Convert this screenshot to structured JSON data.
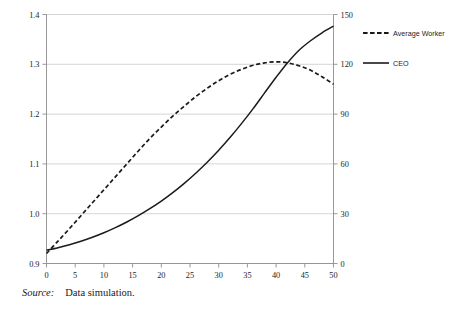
{
  "source_note": {
    "label": "Source:",
    "text": "Data simulation."
  },
  "chart_data": {
    "type": "line",
    "title": "",
    "xlabel": "",
    "ylabel": "",
    "grid": true,
    "legend_position": "right",
    "xlim": [
      0,
      50
    ],
    "xticks": [
      0,
      5,
      10,
      15,
      20,
      25,
      30,
      35,
      40,
      45,
      50
    ],
    "xtick_labels": [
      "0",
      "5",
      "10",
      "15",
      "20",
      "25",
      "30",
      "35",
      "40",
      "45",
      "50"
    ],
    "left_axis": {
      "name": "Average Worker",
      "ylim": [
        0.9,
        1.4
      ],
      "yticks": [
        0.9,
        1.0,
        1.1,
        1.2,
        1.3,
        1.4
      ],
      "ytick_labels": [
        "0.9",
        "1.0",
        "1.1",
        "1.2",
        "1.3",
        "1.4"
      ]
    },
    "right_axis": {
      "name": "CEO",
      "ylim": [
        0,
        150
      ],
      "yticks": [
        0,
        30,
        60,
        90,
        120,
        150
      ],
      "ytick_labels": [
        "0",
        "30",
        "60",
        "90",
        "120",
        "150"
      ]
    },
    "x": [
      0,
      2,
      4,
      6,
      8,
      10,
      12,
      14,
      16,
      18,
      20,
      22,
      24,
      26,
      28,
      30,
      32,
      34,
      36,
      38,
      40,
      42,
      44,
      46,
      48,
      50
    ],
    "series": [
      {
        "name": "Average Worker",
        "axis": "left",
        "style": "dashed",
        "color": "#1a1a1a",
        "values": [
          0.92,
          0.945,
          0.97,
          0.996,
          1.022,
          1.048,
          1.074,
          1.1,
          1.126,
          1.151,
          1.174,
          1.196,
          1.216,
          1.235,
          1.252,
          1.267,
          1.28,
          1.29,
          1.298,
          1.303,
          1.305,
          1.303,
          1.297,
          1.288,
          1.275,
          1.26
        ]
      },
      {
        "name": "CEO",
        "axis": "right",
        "style": "solid",
        "color": "#1a1a1a",
        "values": [
          8,
          9.5,
          11.3,
          13.4,
          15.8,
          18.5,
          21.6,
          25.0,
          28.8,
          33.0,
          37.6,
          42.7,
          48.3,
          54.4,
          61.0,
          68.2,
          76.0,
          84.4,
          93.3,
          102.8,
          112.2,
          121.0,
          128.5,
          134.2,
          139.0,
          143.0
        ]
      }
    ],
    "legend": [
      {
        "label": "Average Worker",
        "style": "dashed"
      },
      {
        "label": "CEO",
        "style": "solid"
      }
    ]
  }
}
